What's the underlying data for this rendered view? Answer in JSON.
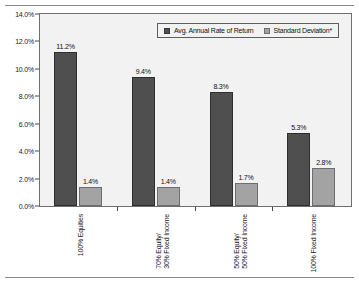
{
  "chart_data": {
    "type": "bar",
    "title": "",
    "xlabel": "",
    "ylabel": "",
    "ylim": [
      0,
      14
    ],
    "ytick_step": 2,
    "grid": false,
    "legend_position": "top-right-inside",
    "ytick_labels": [
      "0.0%",
      "2.0%",
      "4.0%",
      "6.0%",
      "8.0%",
      "10.0%",
      "12.0%",
      "14.0%"
    ],
    "ytick_values": [
      0,
      2,
      4,
      6,
      8,
      10,
      12,
      14
    ],
    "categories": [
      "100% Equities",
      "70% Equity/ 30% Fixed Income",
      "50% Equity/ 50% Fixed Income",
      "100% Fixed Income"
    ],
    "category_lines": [
      [
        "100% Equities"
      ],
      [
        "70% Equity/",
        "30% Fixed Income"
      ],
      [
        "50% Equity/",
        "50% Fixed Income"
      ],
      [
        "100% Fixed Income"
      ]
    ],
    "series": [
      {
        "name": "Avg. Annual Rate of Return",
        "color": "#4f4f4f",
        "values": [
          11.2,
          9.4,
          8.3,
          5.3
        ],
        "labels": [
          "11.2%",
          "9.4%",
          "8.3%",
          "5.3%"
        ]
      },
      {
        "name": "Standard Deviation*",
        "color": "#a3a3a3",
        "values": [
          1.4,
          1.4,
          1.7,
          2.8
        ],
        "labels": [
          "1.4%",
          "1.4%",
          "1.7%",
          "2.8%"
        ]
      }
    ]
  },
  "legend": {
    "items": [
      {
        "label": "Avg. Annual Rate of Return",
        "color": "#4f4f4f"
      },
      {
        "label": "Standard Deviation*",
        "color": "#a3a3a3"
      }
    ]
  },
  "colors": {
    "series_dark": "#4f4f4f",
    "series_light": "#a3a3a3",
    "plot_background": "#f2f2f2",
    "page_background": "#ffffff",
    "axis_line": "#4a4a4a",
    "frame_border": "#6f6f6f",
    "rule": "#8a8a8a",
    "text": "#111111"
  }
}
